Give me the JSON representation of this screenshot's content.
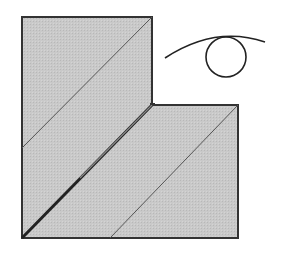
{
  "diagram": {
    "type": "folding-diagram",
    "colors": {
      "paper_fill": "#c8c8c8",
      "outline": "#333333",
      "crease": "#555555",
      "symbol": "#222222",
      "background": "#ffffff"
    },
    "shape": {
      "outline_points": [
        [
          22,
          17
        ],
        [
          152,
          17
        ],
        [
          152,
          105
        ],
        [
          238,
          105
        ],
        [
          238,
          238
        ],
        [
          22,
          238
        ]
      ]
    },
    "creases": [
      {
        "name": "upper-diagonal-crease",
        "from": [
          22,
          148
        ],
        "to": [
          152,
          17
        ]
      },
      {
        "name": "center-fold-edge",
        "from": [
          22,
          238
        ],
        "to": [
          152,
          105
        ]
      },
      {
        "name": "lower-diagonal-crease",
        "from": [
          110,
          238
        ],
        "to": [
          238,
          105
        ]
      }
    ],
    "symbols": [
      {
        "name": "view-eye-symbol",
        "arc_from": [
          165,
          58
        ],
        "arc_to": [
          265,
          42
        ],
        "circle_center": [
          226,
          57
        ],
        "circle_radius": 20
      }
    ]
  }
}
